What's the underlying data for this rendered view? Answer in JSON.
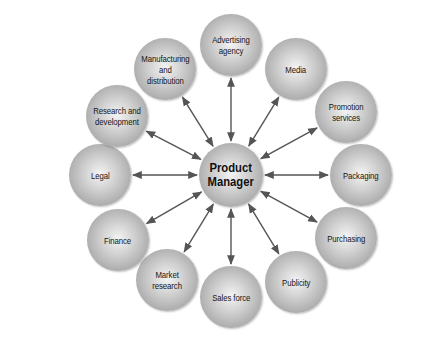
{
  "diagram": {
    "type": "hub-and-spoke",
    "center": {
      "label": "Product\nManager",
      "x": 231,
      "y": 175,
      "r": 32
    },
    "arrow_style": "double-headed",
    "colors": {
      "arrow": "#555555",
      "node_light": "#f4f4f4",
      "node_dark": "#8e8e8e",
      "text": "#151515"
    },
    "nodes": [
      {
        "id": "advertising",
        "label": "Advertising\nagency",
        "x": 231,
        "y": 45,
        "r": 31
      },
      {
        "id": "media",
        "label": "Media",
        "x": 296,
        "y": 69,
        "r": 31
      },
      {
        "id": "promotion",
        "label": "Promotion\nservices",
        "x": 346,
        "y": 112,
        "r": 31
      },
      {
        "id": "packaging",
        "label": "Packaging",
        "x": 361,
        "y": 175,
        "r": 31
      },
      {
        "id": "purchasing",
        "label": "Purchasing",
        "x": 346,
        "y": 238,
        "r": 31
      },
      {
        "id": "publicity",
        "label": "Publicity",
        "x": 296,
        "y": 282,
        "r": 31
      },
      {
        "id": "sales-force",
        "label": "Sales force",
        "x": 231,
        "y": 297,
        "r": 31
      },
      {
        "id": "market-research",
        "label": "Market\nresearch",
        "x": 167,
        "y": 280,
        "r": 31
      },
      {
        "id": "finance",
        "label": "Finance",
        "x": 118,
        "y": 240,
        "r": 31
      },
      {
        "id": "legal",
        "label": "Legal",
        "x": 100,
        "y": 175,
        "r": 31
      },
      {
        "id": "research",
        "label": "Research and\ndevelopment",
        "x": 117,
        "y": 116,
        "r": 31
      },
      {
        "id": "manufacturing",
        "label": "Manufacturing\nand\ndistribution",
        "x": 165,
        "y": 69,
        "r": 31
      }
    ]
  }
}
